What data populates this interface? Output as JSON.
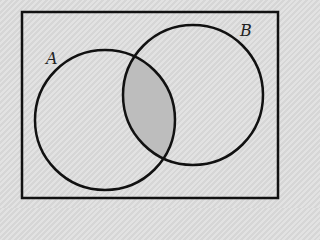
{
  "diagram": {
    "type": "venn",
    "universe": {
      "x": 22,
      "y": 12,
      "width": 256,
      "height": 186,
      "stroke": "#111111"
    },
    "sets": [
      {
        "name": "A",
        "label": "A",
        "cx": 105,
        "cy": 120,
        "r": 70,
        "label_x": 46,
        "label_y": 64
      },
      {
        "name": "B",
        "label": "B",
        "cx": 193,
        "cy": 95,
        "r": 70,
        "label_x": 240,
        "label_y": 36
      }
    ],
    "shaded_region": "A ∩ B",
    "colors": {
      "background": "#dcdcdc",
      "shade": "#bdbdbd",
      "stroke": "#111111"
    }
  }
}
